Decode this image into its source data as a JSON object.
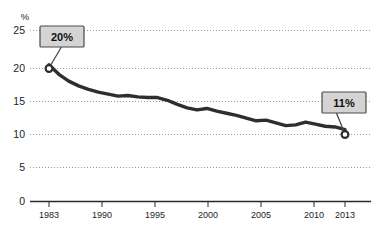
{
  "chart_data": {
    "type": "line",
    "title": "",
    "subtitle": "",
    "xlabel": "",
    "ylabel": "%",
    "ylim": [
      0,
      25
    ],
    "xlim": [
      1983,
      2013
    ],
    "grid": true,
    "legend": false,
    "y_ticks": [
      "0",
      "5",
      "10",
      "15",
      "20",
      "25"
    ],
    "y_tick_values": [
      0,
      5,
      10,
      15,
      20,
      25
    ],
    "x_ticks": [
      "1983",
      "1990",
      "1995",
      "2000",
      "2005",
      "2010",
      "2013"
    ],
    "x_tick_values": [
      1983,
      1990,
      1995,
      2000,
      2005,
      2010,
      2013
    ],
    "x": [
      1983,
      1984,
      1985,
      1986,
      1987,
      1988,
      1989,
      1990,
      1991,
      1992,
      1993,
      1994,
      1995,
      1996,
      1997,
      1998,
      1999,
      2000,
      2001,
      2002,
      2003,
      2004,
      2005,
      2006,
      2007,
      2008,
      2009,
      2010,
      2011,
      2012,
      2013
    ],
    "values": [
      20.0,
      18.6,
      17.6,
      16.9,
      16.4,
      16.0,
      15.7,
      15.4,
      15.5,
      15.3,
      15.2,
      15.2,
      14.8,
      14.2,
      13.7,
      13.4,
      13.6,
      13.2,
      12.9,
      12.6,
      12.2,
      11.8,
      11.9,
      11.5,
      11.1,
      11.2,
      11.6,
      11.3,
      11.0,
      10.9,
      10.5
    ],
    "series": [
      {
        "name": "rate",
        "values": [
          20.0,
          18.6,
          17.6,
          16.9,
          16.4,
          16.0,
          15.7,
          15.4,
          15.5,
          15.3,
          15.2,
          15.2,
          14.8,
          14.2,
          13.7,
          13.4,
          13.6,
          13.2,
          12.9,
          12.6,
          12.2,
          11.8,
          11.9,
          11.5,
          11.1,
          11.2,
          11.6,
          11.3,
          11.0,
          10.9,
          10.5
        ]
      }
    ],
    "annotations": [
      {
        "label": "20%",
        "x": 1983,
        "y": 20.0
      },
      {
        "label": "11%",
        "x": 2013,
        "y": 10.5
      }
    ],
    "colors": {
      "line": "#2e2e2e",
      "grid": "#9a9a9a",
      "axis": "#2b2b2b",
      "callout_fill": "#d4d4d4",
      "callout_border": "#4a4a4a",
      "background": "#ffffff"
    }
  }
}
